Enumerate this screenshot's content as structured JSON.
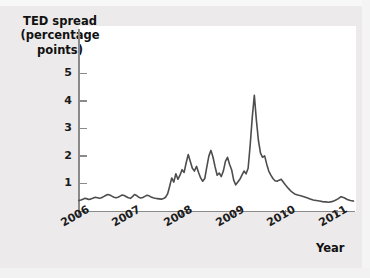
{
  "chart_data": {
    "type": "line",
    "title": "",
    "ylabel": "TED spread (percentage points)",
    "xlabel": "Year",
    "grid": false,
    "legend": null,
    "xlim": [
      2006.0,
      2011.35
    ],
    "ylim": [
      0,
      5.6
    ],
    "yticks": [
      1,
      2,
      3,
      4,
      5
    ],
    "ytick_labels": [
      "1",
      "2",
      "3",
      "4",
      "5"
    ],
    "xticks": [
      2006,
      2007,
      2008,
      2009,
      2010,
      2011
    ],
    "xtick_labels": [
      "2006",
      "2007",
      "2008",
      "2009",
      "2010",
      "2011"
    ],
    "series": [
      {
        "name": "TED spread",
        "color": "#4d4d4d",
        "x": [
          2006.0,
          2006.04,
          2006.08,
          2006.12,
          2006.16,
          2006.2,
          2006.24,
          2006.28,
          2006.32,
          2006.36,
          2006.4,
          2006.44,
          2006.48,
          2006.52,
          2006.56,
          2006.6,
          2006.64,
          2006.68,
          2006.72,
          2006.76,
          2006.8,
          2006.84,
          2006.88,
          2006.92,
          2006.96,
          2007.0,
          2007.04,
          2007.08,
          2007.12,
          2007.16,
          2007.2,
          2007.24,
          2007.28,
          2007.32,
          2007.36,
          2007.4,
          2007.44,
          2007.48,
          2007.52,
          2007.56,
          2007.6,
          2007.64,
          2007.68,
          2007.72,
          2007.76,
          2007.8,
          2007.84,
          2007.88,
          2007.92,
          2007.96,
          2008.0,
          2008.04,
          2008.08,
          2008.12,
          2008.16,
          2008.2,
          2008.24,
          2008.28,
          2008.32,
          2008.36,
          2008.4,
          2008.44,
          2008.48,
          2008.52,
          2008.56,
          2008.6,
          2008.64,
          2008.68,
          2008.72,
          2008.76,
          2008.8,
          2008.84,
          2008.88,
          2008.92,
          2008.96,
          2009.0,
          2009.04,
          2009.08,
          2009.12,
          2009.16,
          2009.2,
          2009.24,
          2009.28,
          2009.32,
          2009.36,
          2009.4,
          2009.44,
          2009.48,
          2009.52,
          2009.56,
          2009.6,
          2009.64,
          2009.68,
          2009.72,
          2009.76,
          2009.8,
          2009.84,
          2009.88,
          2009.92,
          2009.96,
          2010.0,
          2010.06,
          2010.12,
          2010.18,
          2010.24,
          2010.3,
          2010.36,
          2010.42,
          2010.48,
          2010.54,
          2010.6,
          2010.66,
          2010.72,
          2010.78,
          2010.84,
          2010.9,
          2010.96,
          2011.02,
          2011.08,
          2011.14,
          2011.2,
          2011.26,
          2011.32
        ],
        "y": [
          0.38,
          0.4,
          0.43,
          0.46,
          0.44,
          0.42,
          0.44,
          0.47,
          0.5,
          0.48,
          0.46,
          0.48,
          0.52,
          0.56,
          0.6,
          0.58,
          0.54,
          0.5,
          0.48,
          0.5,
          0.54,
          0.58,
          0.56,
          0.52,
          0.48,
          0.46,
          0.52,
          0.6,
          0.56,
          0.5,
          0.47,
          0.49,
          0.53,
          0.57,
          0.55,
          0.51,
          0.48,
          0.46,
          0.45,
          0.44,
          0.43,
          0.45,
          0.5,
          0.62,
          0.9,
          1.2,
          1.05,
          1.35,
          1.15,
          1.3,
          1.5,
          1.4,
          1.75,
          2.05,
          1.8,
          1.55,
          1.45,
          1.62,
          1.4,
          1.2,
          1.08,
          1.18,
          1.6,
          2.0,
          2.2,
          1.95,
          1.6,
          1.3,
          1.38,
          1.25,
          1.45,
          1.8,
          1.95,
          1.7,
          1.5,
          1.12,
          0.95,
          1.05,
          1.15,
          1.3,
          1.45,
          1.35,
          1.55,
          2.4,
          3.4,
          4.2,
          3.3,
          2.55,
          2.1,
          1.95,
          2.0,
          1.7,
          1.45,
          1.3,
          1.18,
          1.1,
          1.08,
          1.12,
          1.15,
          1.05,
          0.95,
          0.82,
          0.7,
          0.62,
          0.58,
          0.55,
          0.52,
          0.48,
          0.44,
          0.4,
          0.38,
          0.36,
          0.34,
          0.33,
          0.32,
          0.34,
          0.38,
          0.44,
          0.52,
          0.48,
          0.42,
          0.38,
          0.36
        ]
      }
    ]
  },
  "axes": {
    "y_title_lines": [
      "TED spread",
      "(percentage",
      "points)"
    ],
    "x_title": "Year"
  }
}
